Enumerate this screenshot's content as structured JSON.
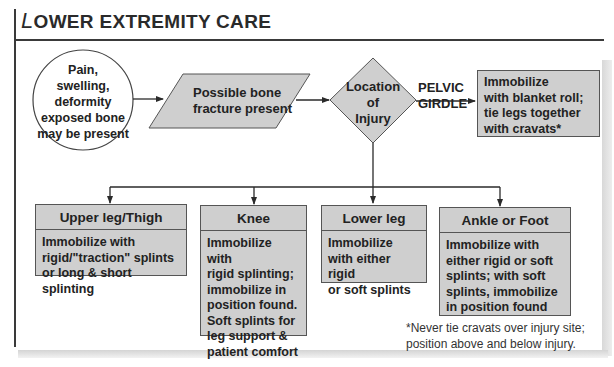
{
  "title": {
    "initial": "L",
    "rest": "OWER EXTREMITY CARE"
  },
  "flow": {
    "start": {
      "shape": "circle",
      "lines": [
        "Pain,",
        "swelling,",
        "deformity",
        "exposed bone",
        "may be present"
      ]
    },
    "process": {
      "shape": "parallelogram",
      "lines": [
        "Possible bone",
        "fracture present"
      ]
    },
    "decision": {
      "shape": "diamond",
      "lines": [
        "Location",
        "of",
        "Injury"
      ]
    },
    "branch_pelvic": {
      "label_lines": [
        "PELVIC",
        "GIRDLE"
      ],
      "action_lines": [
        "Immobilize",
        "with blanket roll;",
        "tie legs together",
        "with cravats*"
      ]
    },
    "branches": [
      {
        "heading": "Upper leg/Thigh",
        "lines": [
          "Immobilize with",
          "rigid/\"traction\" splints",
          "or long & short splinting"
        ]
      },
      {
        "heading": "Knee",
        "lines": [
          "Immobilize with",
          "rigid splinting;",
          "immobilize in",
          "position found.",
          "Soft splints for",
          "leg support &",
          "patient comfort"
        ]
      },
      {
        "heading": "Lower leg",
        "lines": [
          "Immobilize",
          "with either rigid",
          "or soft splints"
        ]
      },
      {
        "heading": "Ankle or Foot",
        "lines": [
          "Immobilize with",
          "either rigid or soft",
          "splints; with soft",
          "splints, immobilize",
          "in position found"
        ]
      }
    ]
  },
  "footnote": {
    "lines": [
      "*Never tie cravats over injury site;",
      "position above and below injury."
    ]
  },
  "colors": {
    "shape_fill": "#cfcfcf",
    "line": "#333333",
    "background": "#ffffff"
  }
}
